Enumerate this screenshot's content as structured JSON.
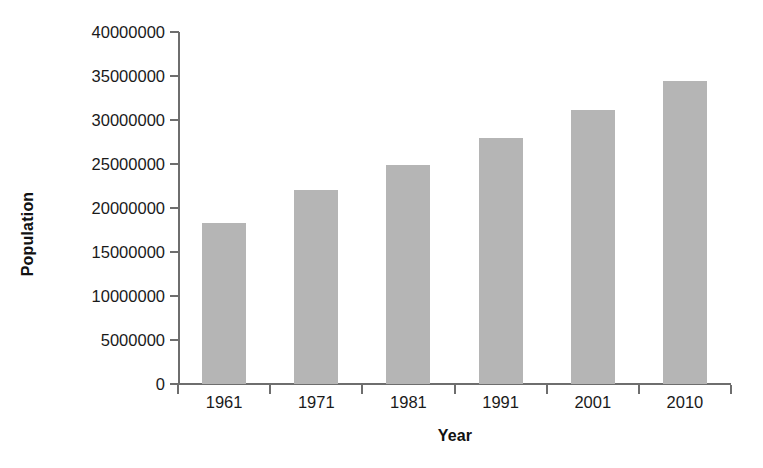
{
  "chart_data": {
    "type": "bar",
    "title": "",
    "xlabel": "Year",
    "ylabel": "Population",
    "categories": [
      "1961",
      "1971",
      "1981",
      "1991",
      "2001",
      "2010"
    ],
    "values": [
      18300000,
      22100000,
      24900000,
      28000000,
      31100000,
      34400000
    ],
    "ylim": [
      0,
      40000000
    ],
    "ytick_values": [
      0,
      5000000,
      10000000,
      15000000,
      20000000,
      25000000,
      30000000,
      35000000,
      40000000
    ],
    "ytick_labels": [
      "0",
      "5000000",
      "10000000",
      "15000000",
      "20000000",
      "25000000",
      "30000000",
      "35000000",
      "40000000"
    ],
    "ytick_step": 5000000,
    "grid": false,
    "legend": false,
    "bar_color": "#b5b5b5",
    "axis_color": "#6e6e6e",
    "text_color": "#1a1a1a",
    "background": "#ffffff"
  }
}
